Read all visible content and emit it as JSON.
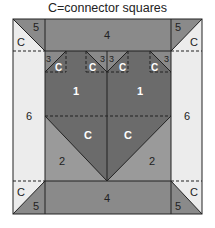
{
  "title": "C=connector squares",
  "colors": {
    "dark": "#6b6b6b",
    "medium": "#8a8a8a",
    "mediumLight": "#9c9c9c",
    "light": "#ececec",
    "line": "#222222"
  },
  "labels": {
    "top_band": "4",
    "bottom_band": "4",
    "corner_tl_piece": "5",
    "corner_tl_connector": "C",
    "corner_tr_piece": "5",
    "corner_tr_connector": "C",
    "corner_bl_piece": "5",
    "corner_bl_connector": "C",
    "corner_br_piece": "5",
    "corner_br_connector": "C",
    "side_left": "6",
    "side_right": "6",
    "unit_left": "1",
    "unit_right": "1",
    "small_piece_1": "3",
    "small_connector_1": "C",
    "small_piece_2": "3",
    "small_connector_2": "C",
    "small_piece_3": "3",
    "small_connector_3": "C",
    "small_piece_4": "3",
    "small_connector_4": "C",
    "center_connector_left": "C",
    "center_connector_right": "C",
    "lower_left": "2",
    "lower_right": "2"
  }
}
